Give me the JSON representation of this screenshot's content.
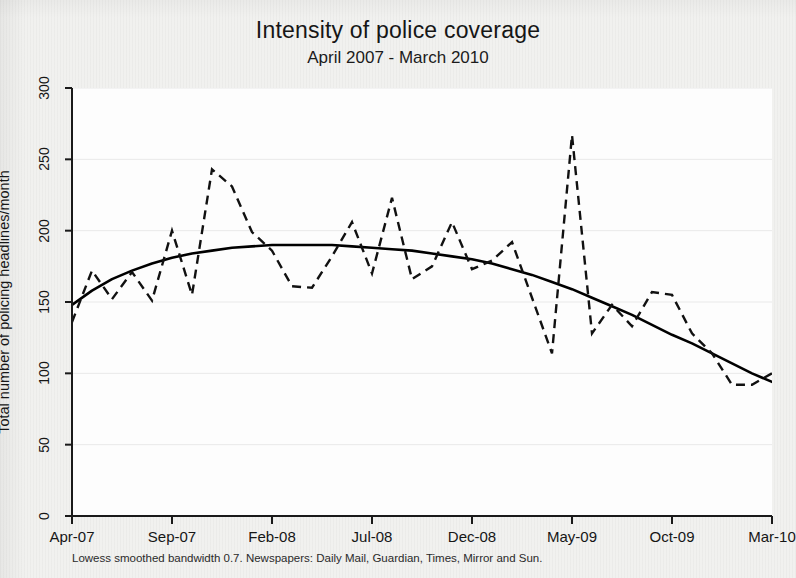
{
  "header": {
    "title": "Intensity of police coverage",
    "subtitle": "April 2007 - March 2010"
  },
  "footnote": "Lowess smoothed bandwidth 0.7. Newspapers: Daily Mail, Guardian, Times, Mirror and Sun.",
  "colors": {
    "ink": "#161616",
    "series_line": "#111111",
    "smooth_line": "#000000",
    "plot_background": "#fdfdfd",
    "page_background": "#f1f1ef",
    "gridline": "#e9e9e9"
  },
  "chart_data": {
    "type": "line",
    "title": "Intensity of police coverage",
    "subtitle": "April 2007 - March 2010",
    "xlabel": "",
    "ylabel": "Total number of policing headlines/month",
    "ylim": [
      0,
      300
    ],
    "yticks": [
      0,
      50,
      100,
      150,
      200,
      250,
      300
    ],
    "ytick_labels": [
      "0",
      "50",
      "100",
      "150",
      "200",
      "250",
      "300"
    ],
    "xtick_labels": [
      "Apr-07",
      "Sep-07",
      "Feb-08",
      "Jul-08",
      "Dec-08",
      "May-09",
      "Oct-09",
      "Mar-10"
    ],
    "xtick_index": [
      0,
      5,
      10,
      15,
      20,
      25,
      30,
      35
    ],
    "grid": "horizontal",
    "legend": "none",
    "x": [
      "Apr-07",
      "May-07",
      "Jun-07",
      "Jul-07",
      "Aug-07",
      "Sep-07",
      "Oct-07",
      "Nov-07",
      "Dec-07",
      "Jan-08",
      "Feb-08",
      "Mar-08",
      "Apr-08",
      "May-08",
      "Jun-08",
      "Jul-08",
      "Aug-08",
      "Sep-08",
      "Oct-08",
      "Nov-08",
      "Dec-08",
      "Jan-09",
      "Feb-09",
      "Mar-09",
      "Apr-09",
      "May-09",
      "Jun-09",
      "Jul-09",
      "Aug-09",
      "Sep-09",
      "Oct-09",
      "Nov-09",
      "Dec-09",
      "Jan-10",
      "Feb-10",
      "Mar-10"
    ],
    "series": [
      {
        "name": "Total policing headlines/month",
        "style": "dashed",
        "values": [
          136,
          172,
          152,
          171,
          151,
          200,
          155,
          243,
          231,
          199,
          186,
          161,
          160,
          182,
          206,
          170,
          223,
          166,
          175,
          206,
          173,
          179,
          192,
          153,
          114,
          267,
          128,
          148,
          133,
          157,
          155,
          128,
          114,
          92,
          92,
          100
        ]
      },
      {
        "name": "Lowess smoothed trend",
        "style": "solid",
        "values": [
          148,
          158,
          166,
          172,
          177,
          181,
          184,
          186,
          188,
          189,
          190,
          190,
          190,
          190,
          189,
          188,
          187,
          186,
          184,
          182,
          180,
          177,
          173,
          169,
          164,
          159,
          153,
          147,
          141,
          134,
          127,
          121,
          114,
          107,
          100,
          94
        ]
      }
    ]
  }
}
